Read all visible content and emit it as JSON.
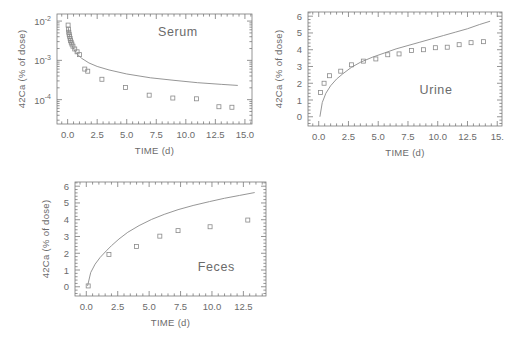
{
  "figure": {
    "background": "#ffffff",
    "ink_color": "#6b6b6b",
    "curve_color": "#8a8a8a",
    "marker_shape": "open-square"
  },
  "chart_data": [
    {
      "id": "serum",
      "type": "scatter",
      "title": "Serum",
      "xlabel": "TIME (d)",
      "ylabel": "42Ca (% of dose)",
      "xlim": [
        -0.9,
        15.6
      ],
      "ylim_log10": [
        -4.62,
        -1.82
      ],
      "yscale": "log",
      "grid": false,
      "xticks": [
        0.0,
        2.5,
        5.0,
        7.5,
        10.0,
        12.5,
        15.0
      ],
      "xticklabels": [
        "0.0",
        "2.5",
        "5.0",
        "7.5",
        "10.0",
        "12.5",
        "15.0"
      ],
      "yticks_log10": [
        -2,
        -3,
        -4
      ],
      "yticklabels": [
        "10^-2",
        "10^-3",
        "10^-4"
      ],
      "points": [
        {
          "x": 0.04,
          "y": 0.0079
        },
        {
          "x": 0.07,
          "y": 0.0062
        },
        {
          "x": 0.1,
          "y": 0.0052
        },
        {
          "x": 0.13,
          "y": 0.0046
        },
        {
          "x": 0.17,
          "y": 0.0041
        },
        {
          "x": 0.21,
          "y": 0.0036
        },
        {
          "x": 0.25,
          "y": 0.0032
        },
        {
          "x": 0.3,
          "y": 0.0029
        },
        {
          "x": 0.36,
          "y": 0.0026
        },
        {
          "x": 0.45,
          "y": 0.0023
        },
        {
          "x": 0.6,
          "y": 0.00195
        },
        {
          "x": 0.8,
          "y": 0.00165
        },
        {
          "x": 1.0,
          "y": 0.0014
        },
        {
          "x": 1.45,
          "y": 0.0006
        },
        {
          "x": 1.7,
          "y": 0.00053
        },
        {
          "x": 2.9,
          "y": 0.00033
        },
        {
          "x": 4.9,
          "y": 0.000205
        },
        {
          "x": 6.9,
          "y": 0.00013
        },
        {
          "x": 8.9,
          "y": 0.00011
        },
        {
          "x": 10.9,
          "y": 0.000105
        },
        {
          "x": 12.8,
          "y": 6.6e-05
        },
        {
          "x": 13.9,
          "y": 6.4e-05
        }
      ],
      "curve": [
        {
          "x": 0.05,
          "y": 0.0069
        },
        {
          "x": 0.1,
          "y": 0.0051
        },
        {
          "x": 0.2,
          "y": 0.0036
        },
        {
          "x": 0.35,
          "y": 0.0025
        },
        {
          "x": 0.55,
          "y": 0.00185
        },
        {
          "x": 0.8,
          "y": 0.00145
        },
        {
          "x": 1.2,
          "y": 0.00112
        },
        {
          "x": 1.8,
          "y": 0.00086
        },
        {
          "x": 2.5,
          "y": 0.0007
        },
        {
          "x": 3.5,
          "y": 0.00057
        },
        {
          "x": 5.0,
          "y": 0.00045
        },
        {
          "x": 7.0,
          "y": 0.00036
        },
        {
          "x": 9.0,
          "y": 0.00031
        },
        {
          "x": 11.0,
          "y": 0.00027
        },
        {
          "x": 13.0,
          "y": 0.000245
        },
        {
          "x": 14.4,
          "y": 0.00023
        }
      ]
    },
    {
      "id": "urine",
      "type": "scatter",
      "title": "Urine",
      "xlabel": "TIME (d)",
      "ylabel": "42Ca (% of dose)",
      "xlim": [
        -0.9,
        15.4
      ],
      "ylim": [
        -0.55,
        6.25
      ],
      "yscale": "linear",
      "grid": false,
      "xticks": [
        0.0,
        2.5,
        5.0,
        7.5,
        10.0,
        12.5,
        15.0
      ],
      "xticklabels": [
        "0.0",
        "2.5",
        "5.0",
        "7.5",
        "10.0",
        "12.5",
        "15."
      ],
      "yticks": [
        0,
        1,
        2,
        3,
        4,
        5,
        6
      ],
      "yticklabels": [
        "0",
        "1",
        "2",
        "3",
        "4",
        "5",
        "6"
      ],
      "points": [
        {
          "x": 0.15,
          "y": 1.45
        },
        {
          "x": 0.45,
          "y": 2.0
        },
        {
          "x": 0.9,
          "y": 2.45
        },
        {
          "x": 1.85,
          "y": 2.72
        },
        {
          "x": 2.75,
          "y": 3.1
        },
        {
          "x": 3.75,
          "y": 3.32
        },
        {
          "x": 4.8,
          "y": 3.45
        },
        {
          "x": 5.8,
          "y": 3.7
        },
        {
          "x": 6.75,
          "y": 3.75
        },
        {
          "x": 7.8,
          "y": 3.95
        },
        {
          "x": 8.8,
          "y": 4.0
        },
        {
          "x": 9.8,
          "y": 4.12
        },
        {
          "x": 10.8,
          "y": 4.15
        },
        {
          "x": 11.8,
          "y": 4.3
        },
        {
          "x": 12.8,
          "y": 4.42
        },
        {
          "x": 13.85,
          "y": 4.48
        }
      ],
      "curve": [
        {
          "x": 0.1,
          "y": 0.0
        },
        {
          "x": 0.3,
          "y": 0.85
        },
        {
          "x": 0.6,
          "y": 1.4
        },
        {
          "x": 1.0,
          "y": 1.85
        },
        {
          "x": 1.5,
          "y": 2.25
        },
        {
          "x": 2.0,
          "y": 2.55
        },
        {
          "x": 2.75,
          "y": 2.95
        },
        {
          "x": 3.5,
          "y": 3.25
        },
        {
          "x": 4.5,
          "y": 3.55
        },
        {
          "x": 5.5,
          "y": 3.8
        },
        {
          "x": 6.5,
          "y": 4.05
        },
        {
          "x": 7.5,
          "y": 4.25
        },
        {
          "x": 8.5,
          "y": 4.45
        },
        {
          "x": 9.5,
          "y": 4.65
        },
        {
          "x": 10.5,
          "y": 4.85
        },
        {
          "x": 11.5,
          "y": 5.05
        },
        {
          "x": 12.5,
          "y": 5.25
        },
        {
          "x": 13.5,
          "y": 5.5
        },
        {
          "x": 14.4,
          "y": 5.7
        }
      ]
    },
    {
      "id": "feces",
      "type": "scatter",
      "title": "Feces",
      "xlabel": "TIME (d)",
      "ylabel": "42Ca (% of dose)",
      "xlim": [
        -0.9,
        14.3
      ],
      "ylim": [
        -0.55,
        6.25
      ],
      "yscale": "linear",
      "grid": false,
      "xticks": [
        0.0,
        2.5,
        5.0,
        7.5,
        10.0,
        12.5
      ],
      "xticklabels": [
        "0.0",
        "2.5",
        "5.0",
        "7.5",
        "10.0",
        "12.5"
      ],
      "yticks": [
        0,
        1,
        2,
        3,
        4,
        5,
        6
      ],
      "yticklabels": [
        "0",
        "1",
        "2",
        "3",
        "4",
        "5",
        "6"
      ],
      "points": [
        {
          "x": 0.15,
          "y": 0.05
        },
        {
          "x": 1.8,
          "y": 1.92
        },
        {
          "x": 4.0,
          "y": 2.4
        },
        {
          "x": 5.85,
          "y": 3.02
        },
        {
          "x": 7.3,
          "y": 3.35
        },
        {
          "x": 9.85,
          "y": 3.58
        },
        {
          "x": 12.85,
          "y": 3.98
        }
      ],
      "curve": [
        {
          "x": 0.1,
          "y": 0.05
        },
        {
          "x": 0.35,
          "y": 0.85
        },
        {
          "x": 0.7,
          "y": 1.35
        },
        {
          "x": 1.1,
          "y": 1.75
        },
        {
          "x": 1.6,
          "y": 2.15
        },
        {
          "x": 2.0,
          "y": 2.45
        },
        {
          "x": 2.6,
          "y": 2.85
        },
        {
          "x": 3.3,
          "y": 3.25
        },
        {
          "x": 4.2,
          "y": 3.65
        },
        {
          "x": 5.2,
          "y": 4.02
        },
        {
          "x": 6.2,
          "y": 4.32
        },
        {
          "x": 7.3,
          "y": 4.6
        },
        {
          "x": 8.5,
          "y": 4.85
        },
        {
          "x": 9.8,
          "y": 5.08
        },
        {
          "x": 11.0,
          "y": 5.28
        },
        {
          "x": 12.2,
          "y": 5.45
        },
        {
          "x": 13.4,
          "y": 5.62
        }
      ]
    }
  ]
}
